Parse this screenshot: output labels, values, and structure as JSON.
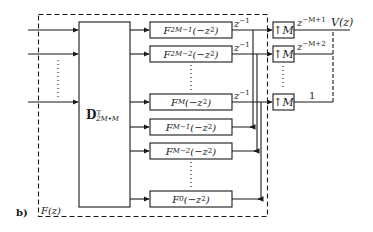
{
  "diagram": {
    "panel_label": "b)",
    "system_label": "F(z)",
    "matrix_block": {
      "base": "D",
      "sup": "T",
      "sub": "2M•M"
    },
    "filters": [
      {
        "name": "F",
        "sub": "2M−1",
        "arg": "(−z",
        "pow": "2",
        "close": ")",
        "delay": "z",
        "delay_sup": "−1"
      },
      {
        "name": "F",
        "sub": "2M−2",
        "arg": "(−z",
        "pow": "2",
        "close": ")",
        "delay": "z",
        "delay_sup": "−1"
      },
      {
        "name": "F",
        "sub": "M",
        "arg": "(−z",
        "pow": "2",
        "close": ")",
        "delay": "z",
        "delay_sup": "−1"
      },
      {
        "name": "F",
        "sub": "M−1",
        "arg": "(−z",
        "pow": "2",
        "close": ")"
      },
      {
        "name": "F",
        "sub": "M−2",
        "arg": "(−z",
        "pow": "2",
        "close": ")"
      },
      {
        "name": "F",
        "sub": "0",
        "arg": "(−z",
        "pow": "2",
        "close": ")"
      }
    ],
    "upsamplers": [
      {
        "label": "↑M",
        "out": "z",
        "out_sup": "−M+1"
      },
      {
        "label": "↑M",
        "out": "z",
        "out_sup": "−M+2"
      },
      {
        "label": "↑M",
        "out": "1",
        "out_sup": ""
      }
    ],
    "output_label": "V(z)"
  }
}
